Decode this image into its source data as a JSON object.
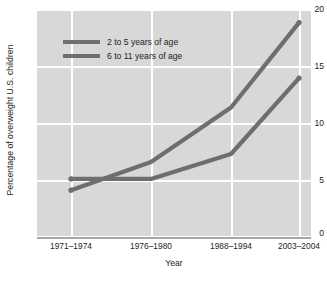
{
  "chart_data": {
    "type": "line",
    "title": "",
    "xlabel": "Year",
    "ylabel": "Percentage of overweight U.S. children",
    "categories": [
      "1971–1974",
      "1976–1980",
      "1988–1994",
      "2003–2004"
    ],
    "yticks": [
      "0",
      "5",
      "10",
      "15",
      "20"
    ],
    "ytick_values": [
      0,
      5,
      10,
      15,
      20
    ],
    "ylim": [
      0,
      20
    ],
    "grid": true,
    "legend_position": "upper-left-inside",
    "series": [
      {
        "name": "2 to 5 years of age",
        "values": [
          5.0,
          5.0,
          7.2,
          13.9
        ],
        "color": "#6d6e71"
      },
      {
        "name": "6 to 11 years of age",
        "values": [
          4.0,
          6.5,
          11.3,
          18.8
        ],
        "color": "#6d6e71"
      }
    ]
  },
  "axis": {
    "y_title": "Percentage of overweight U.S. children",
    "x_title": "Year",
    "y_tick_labels": [
      "20",
      "15",
      "10",
      "5",
      "0"
    ],
    "x_tick_labels": [
      "1971–1974",
      "1976–1980",
      "1988–1994",
      "2003–2004"
    ]
  },
  "legend": {
    "items": [
      {
        "label": "2 to 5 years of age"
      },
      {
        "label": "6 to 11 years of age"
      }
    ]
  },
  "colors": {
    "plot_background": "#d8d8d8",
    "gridline": "#ffffff",
    "line": "#6d6e71",
    "axis_line": "#a7a7a7",
    "text": "#231f20",
    "page_background": "#ffffff"
  }
}
